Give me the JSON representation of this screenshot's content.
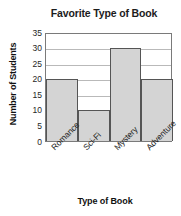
{
  "chart_data": {
    "type": "bar",
    "title": "Favorite Type of Book",
    "xlabel": "Type of Book",
    "ylabel": "Number of Students",
    "categories": [
      "Romance",
      "Sci-Fi",
      "Mystery",
      "Adventure"
    ],
    "values": [
      20,
      10,
      30,
      20
    ],
    "yticks": [
      0,
      5,
      10,
      15,
      20,
      25,
      30,
      35
    ],
    "ylim": [
      0,
      35
    ],
    "grid": true,
    "legend": false,
    "bar_color": "#d4d4d4",
    "bar_border_color": "#555555",
    "gridline_color": "#b9b9b9",
    "axis_color": "#7a7a7a",
    "background": "#ffffff",
    "xtick_rotation": -45
  }
}
